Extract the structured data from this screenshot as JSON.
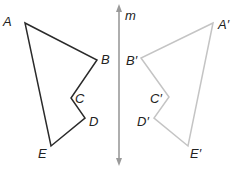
{
  "figure": {
    "mirror_line": {
      "label": "m",
      "x": 119,
      "y1": 4,
      "y2": 166,
      "color": "#9a9a9a"
    },
    "original": {
      "color": "#2a2a2a",
      "vertices": [
        {
          "label": "A",
          "x": 25,
          "y": 23,
          "lx": 3,
          "ly": 26
        },
        {
          "label": "B",
          "x": 97,
          "y": 60,
          "lx": 101,
          "ly": 64
        },
        {
          "label": "C",
          "x": 71,
          "y": 98,
          "lx": 75,
          "ly": 103
        },
        {
          "label": "D",
          "x": 85,
          "y": 118,
          "lx": 89,
          "ly": 126
        },
        {
          "label": "E",
          "x": 51,
          "y": 146,
          "lx": 38,
          "ly": 158
        }
      ]
    },
    "image": {
      "color": "#c4c4c4",
      "vertices": [
        {
          "label": "A′",
          "x": 213,
          "y": 23,
          "lx": 218,
          "ly": 29
        },
        {
          "label": "B′",
          "x": 141,
          "y": 58,
          "lx": 126,
          "ly": 65
        },
        {
          "label": "C′",
          "x": 169,
          "y": 97,
          "lx": 150,
          "ly": 103
        },
        {
          "label": "D′",
          "x": 154,
          "y": 118,
          "lx": 137,
          "ly": 126
        },
        {
          "label": "E′",
          "x": 188,
          "y": 146,
          "lx": 190,
          "ly": 158
        }
      ]
    }
  }
}
